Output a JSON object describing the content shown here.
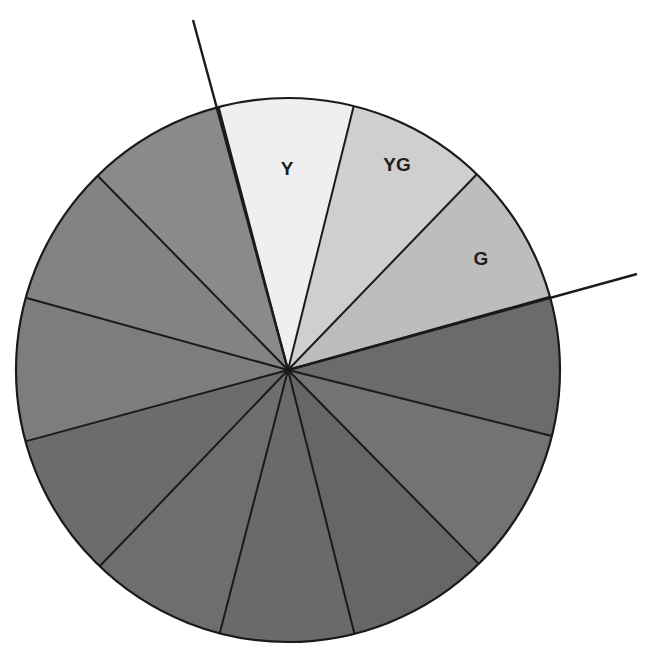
{
  "diagram": {
    "type": "color-wheel",
    "center": [
      288,
      370
    ],
    "radius": 272,
    "outline_color": "#1a1a1a",
    "segments": [
      {
        "label": "Y",
        "color": "#efefef"
      },
      {
        "label": "YG",
        "color": "#cfcfcf"
      },
      {
        "label": "G",
        "color": "#bdbdbd"
      },
      {
        "label": "",
        "color": "#6b6b6b"
      },
      {
        "label": "",
        "color": "#737373"
      },
      {
        "label": "",
        "color": "#666666"
      },
      {
        "label": "",
        "color": "#6a6a6a"
      },
      {
        "label": "",
        "color": "#6e6e6e"
      },
      {
        "label": "",
        "color": "#6c6c6c"
      },
      {
        "label": "",
        "color": "#7d7d7d"
      },
      {
        "label": "",
        "color": "#838383"
      },
      {
        "label": "",
        "color": "#8a8a8a"
      }
    ],
    "boundary_points": [
      [
        216,
        97
      ],
      [
        355,
        101
      ],
      [
        477,
        174
      ],
      [
        549,
        297
      ],
      [
        556,
        437
      ],
      [
        478,
        563
      ],
      [
        356,
        640
      ],
      [
        218,
        640
      ],
      [
        100,
        566
      ],
      [
        27,
        441
      ],
      [
        27,
        298
      ],
      [
        96,
        174
      ]
    ],
    "label_positions": [
      [
        287,
        175
      ],
      [
        397,
        171
      ],
      [
        481,
        265
      ]
    ],
    "marker_lines": [
      {
        "name": "marker-line-top",
        "from": [
          288,
          370
        ],
        "to": [
          193,
          20
        ]
      },
      {
        "name": "marker-line-right",
        "from": [
          288,
          370
        ],
        "to": [
          637,
          274
        ]
      }
    ]
  }
}
